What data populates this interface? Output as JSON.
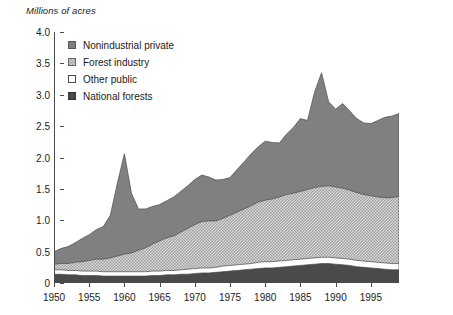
{
  "chart_data": {
    "type": "area",
    "stacked": true,
    "title": "",
    "ylabel": "Millions of acres",
    "xlabel": "",
    "ylim": [
      0,
      4.0
    ],
    "xlim": [
      1950,
      1999
    ],
    "grid": false,
    "legend_position": "top-left-inside",
    "y_ticks": [
      "0",
      "0.5",
      "1.0",
      "1.5",
      "2.0",
      "2.5",
      "3.0",
      "3.5",
      "4.0"
    ],
    "y_tick_values": [
      0,
      0.5,
      1.0,
      1.5,
      2.0,
      2.5,
      3.0,
      3.5,
      4.0
    ],
    "x_ticks": [
      "1950",
      "1955",
      "1960",
      "1965",
      "1970",
      "1975",
      "1980",
      "1985",
      "1990",
      "1995"
    ],
    "x_tick_values": [
      1950,
      1955,
      1960,
      1965,
      1970,
      1975,
      1980,
      1985,
      1990,
      1995
    ],
    "x": [
      1950,
      1951,
      1952,
      1953,
      1954,
      1955,
      1956,
      1957,
      1958,
      1959,
      1960,
      1961,
      1962,
      1963,
      1964,
      1965,
      1966,
      1967,
      1968,
      1969,
      1970,
      1971,
      1972,
      1973,
      1974,
      1975,
      1976,
      1977,
      1978,
      1979,
      1980,
      1981,
      1982,
      1983,
      1984,
      1985,
      1986,
      1987,
      1988,
      1989,
      1990,
      1991,
      1992,
      1993,
      1994,
      1995,
      1996,
      1997,
      1998,
      1999
    ],
    "series": [
      {
        "name": "National forests",
        "color": "#4a4a4a",
        "pattern": "solid-dark",
        "values": [
          0.14,
          0.14,
          0.13,
          0.13,
          0.12,
          0.12,
          0.12,
          0.11,
          0.11,
          0.11,
          0.11,
          0.11,
          0.11,
          0.11,
          0.12,
          0.12,
          0.13,
          0.13,
          0.14,
          0.14,
          0.15,
          0.16,
          0.16,
          0.17,
          0.18,
          0.19,
          0.2,
          0.21,
          0.22,
          0.23,
          0.24,
          0.24,
          0.25,
          0.26,
          0.27,
          0.28,
          0.29,
          0.3,
          0.31,
          0.31,
          0.3,
          0.29,
          0.28,
          0.26,
          0.25,
          0.24,
          0.23,
          0.22,
          0.21,
          0.21
        ]
      },
      {
        "name": "Other public",
        "color": "#ffffff",
        "pattern": "solid-white",
        "values": [
          0.07,
          0.07,
          0.07,
          0.07,
          0.07,
          0.07,
          0.07,
          0.07,
          0.07,
          0.07,
          0.07,
          0.07,
          0.07,
          0.07,
          0.07,
          0.07,
          0.07,
          0.07,
          0.07,
          0.08,
          0.08,
          0.08,
          0.08,
          0.08,
          0.09,
          0.09,
          0.09,
          0.09,
          0.09,
          0.1,
          0.1,
          0.1,
          0.1,
          0.1,
          0.1,
          0.1,
          0.1,
          0.1,
          0.1,
          0.1,
          0.1,
          0.1,
          0.1,
          0.1,
          0.1,
          0.1,
          0.1,
          0.1,
          0.1,
          0.1
        ]
      },
      {
        "name": "Forest industry",
        "color": "#d0d0d0",
        "pattern": "checker",
        "values": [
          0.09,
          0.1,
          0.11,
          0.13,
          0.15,
          0.17,
          0.19,
          0.2,
          0.22,
          0.25,
          0.28,
          0.3,
          0.34,
          0.38,
          0.43,
          0.48,
          0.52,
          0.55,
          0.6,
          0.65,
          0.7,
          0.74,
          0.75,
          0.74,
          0.76,
          0.8,
          0.84,
          0.88,
          0.92,
          0.96,
          0.98,
          1.0,
          1.02,
          1.05,
          1.06,
          1.08,
          1.1,
          1.12,
          1.13,
          1.14,
          1.13,
          1.12,
          1.1,
          1.08,
          1.06,
          1.05,
          1.04,
          1.04,
          1.05,
          1.07
        ]
      },
      {
        "name": "Nonindustrial private",
        "color": "#808080",
        "pattern": "solid-gray",
        "values": [
          0.2,
          0.24,
          0.27,
          0.31,
          0.37,
          0.41,
          0.47,
          0.52,
          0.68,
          1.16,
          1.6,
          0.95,
          0.66,
          0.62,
          0.6,
          0.58,
          0.59,
          0.62,
          0.65,
          0.68,
          0.72,
          0.74,
          0.7,
          0.65,
          0.62,
          0.6,
          0.68,
          0.75,
          0.83,
          0.88,
          0.94,
          0.9,
          0.86,
          0.96,
          1.05,
          1.16,
          1.1,
          1.52,
          1.81,
          1.34,
          1.24,
          1.35,
          1.26,
          1.18,
          1.14,
          1.15,
          1.22,
          1.28,
          1.3,
          1.32
        ]
      }
    ],
    "totals": [
      0.5,
      0.55,
      0.58,
      0.64,
      0.71,
      0.77,
      0.85,
      0.9,
      1.08,
      1.59,
      2.06,
      1.43,
      1.18,
      1.18,
      1.22,
      1.25,
      1.31,
      1.37,
      1.46,
      1.55,
      1.65,
      1.72,
      1.69,
      1.64,
      1.65,
      1.68,
      1.81,
      1.93,
      2.06,
      2.17,
      2.26,
      2.24,
      2.23,
      2.37,
      2.48,
      2.62,
      2.59,
      3.04,
      3.35,
      2.89,
      2.77,
      2.86,
      2.74,
      2.62,
      2.55,
      2.54,
      2.59,
      2.64,
      2.66,
      2.7
    ]
  },
  "legend": {
    "items": [
      {
        "label": "Nonindustrial private",
        "swatch": "nonindustrial-private-swatch"
      },
      {
        "label": "Forest industry",
        "swatch": "forest-industry-swatch"
      },
      {
        "label": "Other public",
        "swatch": "other-public-swatch"
      },
      {
        "label": "National forests",
        "swatch": "national-forests-swatch"
      }
    ]
  }
}
